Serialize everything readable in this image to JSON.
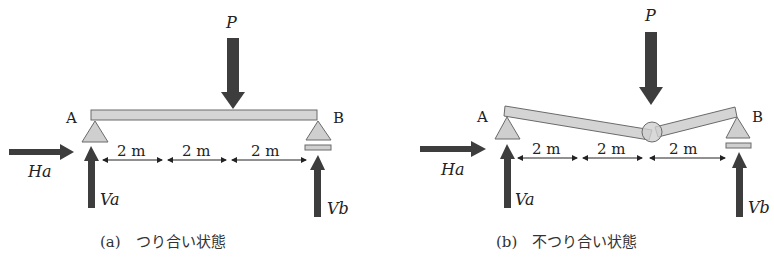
{
  "colors": {
    "arrow": "#3d3d3d",
    "beam_fill": "#d4d4d4",
    "beam_stroke": "#6a6a6a",
    "support_fill": "#cfcfcf",
    "text": "#222222",
    "background": "#ffffff"
  },
  "panels": [
    {
      "id": "a",
      "caption": "(a)　つり合い状態",
      "state": "equilibrium",
      "labels": {
        "load": "P",
        "support_left": "A",
        "support_right": "B",
        "horizontal_reaction": "Ha",
        "vertical_reaction_left": "Va",
        "vertical_reaction_right": "Vb"
      },
      "dimensions": [
        "2 m",
        "2 m",
        "2 m"
      ],
      "beam": "straight",
      "support_left_type": "pin",
      "support_right_type": "roller"
    },
    {
      "id": "b",
      "caption": "(b)　不つり合い状態",
      "state": "non-equilibrium",
      "labels": {
        "load": "P",
        "support_left": "A",
        "support_right": "B",
        "horizontal_reaction": "Ha",
        "vertical_reaction_left": "Va",
        "vertical_reaction_right": "Vb"
      },
      "dimensions": [
        "2 m",
        "2 m",
        "2 m"
      ],
      "beam": "hinged-collapsed",
      "support_left_type": "pin",
      "support_right_type": "roller",
      "hinge_marker": "hinge-circle"
    }
  ]
}
